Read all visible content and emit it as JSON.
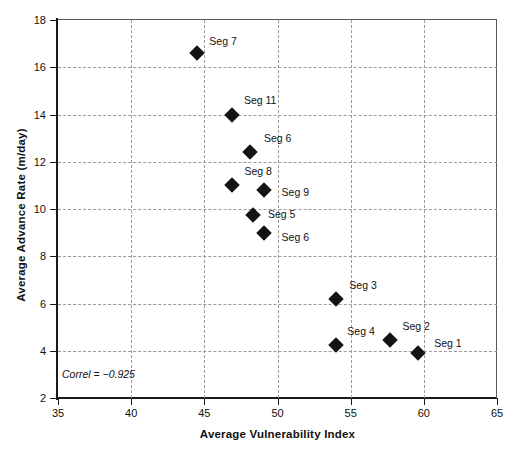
{
  "chart_data": {
    "type": "scatter",
    "title": "",
    "xlabel": "Average Vulnerability Index",
    "ylabel": "Average Advance Rate (m/day)",
    "xlim": [
      35,
      65
    ],
    "ylim": [
      2,
      18
    ],
    "xticks": [
      35,
      40,
      45,
      50,
      55,
      60,
      65
    ],
    "yticks": [
      2,
      4,
      6,
      8,
      10,
      12,
      14,
      16,
      18
    ],
    "grid": true,
    "legend": "none",
    "marker": "filled-diamond",
    "marker_color": "#141414",
    "annotation": "Correl = −0.925",
    "points": [
      {
        "label": "Seg 7",
        "x": 44.5,
        "y": 16.6,
        "label_dx": 26,
        "label_dy": -12
      },
      {
        "label": "Seg 11",
        "x": 46.9,
        "y": 14.0,
        "label_dx": 28,
        "label_dy": -15
      },
      {
        "label": "Seg 6",
        "x": 48.1,
        "y": 12.4,
        "label_dx": 28,
        "label_dy": -14
      },
      {
        "label": "Seg 8",
        "x": 46.9,
        "y": 11.0,
        "label_dx": 26,
        "label_dy": -14
      },
      {
        "label": "Seg 9",
        "x": 49.1,
        "y": 10.8,
        "label_dx": 31,
        "label_dy": 2
      },
      {
        "label": "Seg 5",
        "x": 48.3,
        "y": 9.75,
        "label_dx": 29,
        "label_dy": -1
      },
      {
        "label": "Seg 6",
        "x": 49.1,
        "y": 9.0,
        "label_dx": 31,
        "label_dy": 4
      },
      {
        "label": "Seg 3",
        "x": 54.0,
        "y": 6.2,
        "label_dx": 27,
        "label_dy": -14
      },
      {
        "label": "Seg 4",
        "x": 54.0,
        "y": 4.25,
        "label_dx": 25,
        "label_dy": -14
      },
      {
        "label": "Seg 2",
        "x": 57.7,
        "y": 4.45,
        "label_dx": 26,
        "label_dy": -14
      },
      {
        "label": "Seg 1",
        "x": 59.6,
        "y": 3.9,
        "label_dx": 30,
        "label_dy": -10
      }
    ]
  }
}
